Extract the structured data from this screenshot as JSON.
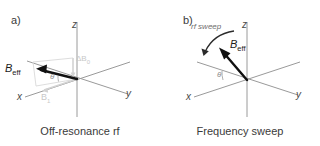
{
  "figure": {
    "background_color": "#ffffff",
    "axis_color": "#9a9a9a",
    "vector_color": "#111111",
    "faint_color": "#cccccc",
    "text_color": "#3a3a3a"
  },
  "panels": [
    {
      "key": "a",
      "label": "a)",
      "caption": "Off-resonance rf",
      "axes": [
        {
          "name": "x",
          "label": "x"
        },
        {
          "name": "y",
          "label": "y"
        },
        {
          "name": "z",
          "label": "z"
        }
      ],
      "vectors": [
        {
          "name": "b-eff",
          "label_base": "B",
          "label_sub": "eff",
          "style": "bold-black"
        }
      ],
      "faint_components": [
        {
          "name": "delta-b0",
          "label_base": "ΔB",
          "label_sub": "0"
        },
        {
          "name": "b1",
          "label_base": "B",
          "label_sub": "1"
        }
      ],
      "angle": {
        "name": "theta",
        "label": "θ"
      }
    },
    {
      "key": "b",
      "label": "b)",
      "caption": "Frequency sweep",
      "axes": [
        {
          "name": "x",
          "label": "x"
        },
        {
          "name": "y",
          "label": "y"
        },
        {
          "name": "z",
          "label": "z"
        }
      ],
      "vectors": [
        {
          "name": "b-eff",
          "label_base": "B",
          "label_sub": "eff",
          "style": "bold-black"
        }
      ],
      "annotations": [
        {
          "name": "rf-sweep",
          "label": "rf sweep"
        }
      ],
      "angle": {
        "name": "theta",
        "label": "θ"
      }
    }
  ]
}
